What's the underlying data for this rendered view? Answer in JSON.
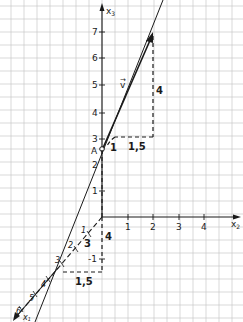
{
  "diagram": {
    "type": "3d-coordinate-sketch",
    "colors": {
      "background": "#ffffff",
      "grid": "#c8c8c8",
      "ink": "#1a1a1a"
    },
    "axes": {
      "x2": {
        "label": "x",
        "sub": "2",
        "ticks": [
          "1",
          "2",
          "3",
          "4"
        ]
      },
      "x3": {
        "label": "x",
        "sub": "3",
        "ticks": [
          "1",
          "2",
          "3",
          "4",
          "5",
          "6",
          "7"
        ]
      },
      "x1": {
        "label": "x",
        "sub": "1",
        "ticks": [
          "1",
          "2",
          "3",
          "4",
          "5",
          "6"
        ],
        "neg_tick": "-1"
      }
    },
    "point": {
      "label": "A"
    },
    "vector": {
      "label": "v",
      "arrow": "→"
    },
    "upper_triangle": {
      "vertical": "4",
      "horizontal": "1,5",
      "step": "1"
    },
    "lower_triangle": {
      "vertical": "4",
      "horizontal": "1,5",
      "diagonal": "3"
    }
  }
}
